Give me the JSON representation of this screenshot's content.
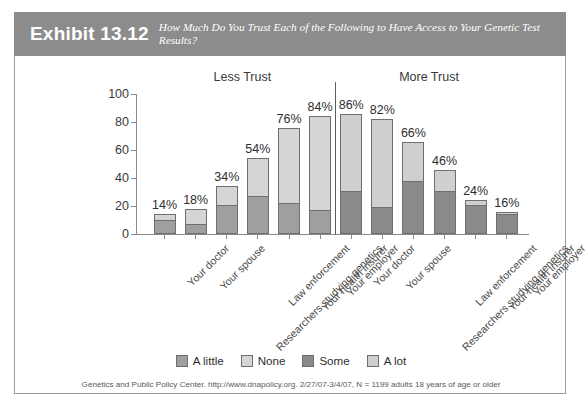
{
  "header": {
    "exhibit_number": "Exhibit 13.12",
    "subtitle": "How Much Do You Trust Each of the Following to Have Access to Your Genetic Test Results?"
  },
  "legend": [
    {
      "label": "A little",
      "color": "#9f9f9f",
      "key": "a_little"
    },
    {
      "label": "None",
      "color": "#d5d5d5",
      "key": "none"
    },
    {
      "label": "Some",
      "color": "#8a8a8a",
      "key": "some"
    },
    {
      "label": "A lot",
      "color": "#cfcfcf",
      "key": "a_lot"
    }
  ],
  "source_note": "Genetics and Public Policy Center. http://www.dnapolicy.org. 2/27/07-3/4/07, N = 1199 adults 18 years of age or older",
  "chart_data": {
    "type": "bar",
    "stacked": true,
    "title": "How Much Do You Trust Each of the Following to Have Access to Your Genetic Test Results?",
    "xlabel": "",
    "ylabel": "",
    "ylim": [
      0,
      100
    ],
    "yticks": [
      0,
      20,
      40,
      60,
      80,
      100
    ],
    "grid": false,
    "legend_position": "bottom",
    "group_labels": [
      "Less Trust",
      "More Trust"
    ],
    "groups": [
      {
        "name": "Less Trust",
        "segments": [
          "A little",
          "None"
        ],
        "segment_colors": [
          "#9f9f9f",
          "#d5d5d5"
        ],
        "categories": [
          "Your doctor",
          "Your spouse",
          "Researchers studying genetics",
          "Law enforcement",
          "Your health insurer",
          "Your employer"
        ],
        "totals": [
          14,
          18,
          34,
          54,
          76,
          84
        ],
        "total_labels": [
          "14%",
          "18%",
          "34%",
          "54%",
          "76%",
          "84%"
        ],
        "series": [
          {
            "name": "A little",
            "values": [
              10,
              7,
              21,
              27,
              22,
              17
            ]
          },
          {
            "name": "None",
            "values": [
              4,
              11,
              13,
              27,
              54,
              67
            ]
          }
        ]
      },
      {
        "name": "More Trust",
        "segments": [
          "Some",
          "A lot"
        ],
        "segment_colors": [
          "#8a8a8a",
          "#cfcfcf"
        ],
        "categories": [
          "Your doctor",
          "Your spouse",
          "Researchers studying genetics",
          "Law enforcement",
          "Your health insurer",
          "Your employer"
        ],
        "totals": [
          86,
          82,
          66,
          46,
          24,
          16
        ],
        "total_labels": [
          "86%",
          "82%",
          "66%",
          "46%",
          "24%",
          "16%"
        ],
        "series": [
          {
            "name": "Some",
            "values": [
              31,
              19,
              38,
              31,
              21,
              14
            ]
          },
          {
            "name": "A lot",
            "values": [
              55,
              63,
              28,
              15,
              3,
              2
            ]
          }
        ]
      }
    ]
  }
}
